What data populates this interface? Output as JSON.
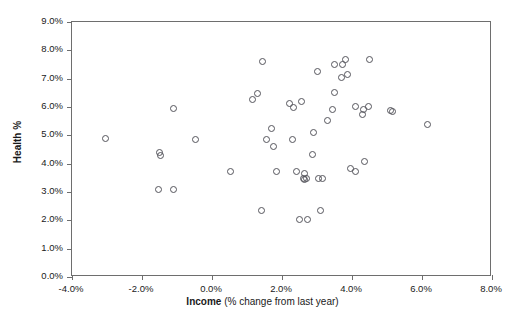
{
  "chart_data": {
    "type": "scatter",
    "title": "",
    "xlabel_bold": "Income",
    "xlabel_rest": " (% change from last year)",
    "ylabel": "Health %",
    "xlim": [
      -4.0,
      8.0
    ],
    "ylim": [
      0.0,
      9.0
    ],
    "xtick_step": 2.0,
    "ytick_step": 1.0,
    "xticks": [
      "-4.0%",
      "-2.0%",
      "0.0%",
      "2.0%",
      "4.0%",
      "6.0%",
      "8.0%"
    ],
    "xtick_values": [
      -4.0,
      -2.0,
      0.0,
      2.0,
      4.0,
      6.0,
      8.0
    ],
    "yticks": [
      "0.0%",
      "1.0%",
      "2.0%",
      "3.0%",
      "4.0%",
      "5.0%",
      "6.0%",
      "7.0%",
      "8.0%",
      "9.0%"
    ],
    "ytick_values": [
      0.0,
      1.0,
      2.0,
      3.0,
      4.0,
      5.0,
      6.0,
      7.0,
      8.0,
      9.0
    ],
    "grid": false,
    "legend": false,
    "marker": "open-circle",
    "marker_color": "#55555c",
    "frame_color": "#6e6e6e",
    "background": "#ffffff",
    "point_count": 52,
    "points": [
      {
        "x": -3.03,
        "y": 4.88
      },
      {
        "x": -1.49,
        "y": 4.4
      },
      {
        "x": -1.46,
        "y": 4.28
      },
      {
        "x": -1.54,
        "y": 3.08
      },
      {
        "x": -1.11,
        "y": 3.08
      },
      {
        "x": -1.09,
        "y": 5.93
      },
      {
        "x": -0.46,
        "y": 4.84
      },
      {
        "x": 0.54,
        "y": 3.73
      },
      {
        "x": 1.17,
        "y": 6.27
      },
      {
        "x": 1.31,
        "y": 6.46
      },
      {
        "x": 1.43,
        "y": 7.62
      },
      {
        "x": 1.4,
        "y": 2.35
      },
      {
        "x": 1.57,
        "y": 4.84
      },
      {
        "x": 1.71,
        "y": 5.23
      },
      {
        "x": 1.77,
        "y": 4.6
      },
      {
        "x": 1.83,
        "y": 3.72
      },
      {
        "x": 2.2,
        "y": 6.14
      },
      {
        "x": 2.34,
        "y": 5.98
      },
      {
        "x": 2.31,
        "y": 4.86
      },
      {
        "x": 2.4,
        "y": 3.74
      },
      {
        "x": 2.49,
        "y": 2.04
      },
      {
        "x": 2.57,
        "y": 6.19
      },
      {
        "x": 2.63,
        "y": 3.66
      },
      {
        "x": 2.6,
        "y": 3.48
      },
      {
        "x": 2.63,
        "y": 3.44
      },
      {
        "x": 2.69,
        "y": 3.47
      },
      {
        "x": 2.74,
        "y": 2.04
      },
      {
        "x": 2.86,
        "y": 4.33
      },
      {
        "x": 2.91,
        "y": 5.09
      },
      {
        "x": 3.01,
        "y": 7.25
      },
      {
        "x": 3.03,
        "y": 3.47
      },
      {
        "x": 3.09,
        "y": 2.35
      },
      {
        "x": 3.17,
        "y": 3.46
      },
      {
        "x": 3.29,
        "y": 5.51
      },
      {
        "x": 3.43,
        "y": 5.92
      },
      {
        "x": 3.49,
        "y": 7.5
      },
      {
        "x": 3.51,
        "y": 6.52
      },
      {
        "x": 3.71,
        "y": 7.05
      },
      {
        "x": 3.74,
        "y": 7.51
      },
      {
        "x": 3.8,
        "y": 7.68
      },
      {
        "x": 3.86,
        "y": 7.14
      },
      {
        "x": 3.97,
        "y": 3.83
      },
      {
        "x": 4.09,
        "y": 3.72
      },
      {
        "x": 4.11,
        "y": 6.03
      },
      {
        "x": 4.29,
        "y": 5.74
      },
      {
        "x": 4.34,
        "y": 5.91
      },
      {
        "x": 4.37,
        "y": 4.06
      },
      {
        "x": 4.46,
        "y": 6.03
      },
      {
        "x": 4.51,
        "y": 7.69
      },
      {
        "x": 5.09,
        "y": 5.86
      },
      {
        "x": 5.17,
        "y": 5.83
      },
      {
        "x": 6.17,
        "y": 5.37
      }
    ]
  }
}
